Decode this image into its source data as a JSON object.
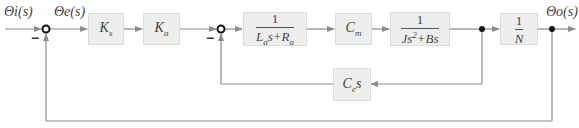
{
  "signals": {
    "input": "Θi(s)",
    "error": "Θe(s)",
    "output": "Θo(s)"
  },
  "summing_junctions": [
    {
      "id": "sum1",
      "signs": {
        "input": "+",
        "feedback": "−"
      },
      "minus_label": "−"
    },
    {
      "id": "sum2",
      "signs": {
        "input": "+",
        "feedback": "−"
      },
      "minus_label": "−"
    }
  ],
  "blocks": {
    "ks": {
      "base": "K",
      "sub": "s"
    },
    "ka": {
      "base": "K",
      "sub": "a"
    },
    "armature": {
      "num": "1",
      "den_a": "L",
      "den_a_sub": "a",
      "den_mid": "s+",
      "den_b": "R",
      "den_b_sub": "a"
    },
    "cm": {
      "base": "C",
      "sub": "m"
    },
    "mech": {
      "num": "1",
      "den_a": "Js",
      "den_sup": "2",
      "den_b": "+Bs"
    },
    "gear": {
      "num": "1",
      "den": "N"
    },
    "backemf": {
      "base": "C",
      "sub": "e",
      "suffix": "s"
    }
  },
  "colors": {
    "line": "#8c8c8c",
    "block_fill": "#eeeeee",
    "block_border": "#dcdcdc",
    "node": "#111111"
  }
}
